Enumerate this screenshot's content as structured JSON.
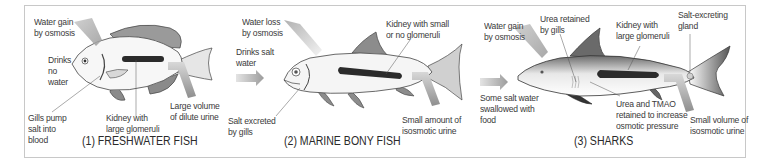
{
  "diagram": {
    "panels": [
      {
        "id": "freshwater",
        "caption": "(1) FRESHWATER FISH",
        "labels": {
          "water_gain": "Water gain\nby osmosis",
          "drinks": "Drinks\nno\nwater",
          "gills": "Gills pump\nsalt into\nblood",
          "kidney": "Kidney with\nlarge glomeruli",
          "urine": "Large volume\nof dilute urine"
        }
      },
      {
        "id": "marine",
        "caption": "(2) MARINE BONY FISH",
        "labels": {
          "water_loss": "Water loss\nby osmosis",
          "drinks": "Drinks salt\nwater",
          "gills": "Salt excreted\nby gills",
          "kidney": "Kidney with small\nor no glomeruli",
          "urine": "Small amount of\nisosmotic urine"
        }
      },
      {
        "id": "sharks",
        "caption": "(3) SHARKS",
        "labels": {
          "water_gain": "Water gain\nby osmosis",
          "urea_gills": "Urea retained\nby gills",
          "kidney": "Kidney with\nlarge glomeruli",
          "gland": "Salt-excreting\ngland",
          "food": "Some salt water\nswallowed with\nfood",
          "urea_tmao": "Urea and TMAO\nretained to increase\nosmotic pressure",
          "urine": "Small volume of\nisosmotic urine"
        }
      }
    ],
    "colors": {
      "frame": "#c8c8c8",
      "text": "#3a3a3a",
      "kidney": "#2b2b2b",
      "arrow": "#9a9a9a",
      "fin": "#8a8a8a"
    }
  }
}
